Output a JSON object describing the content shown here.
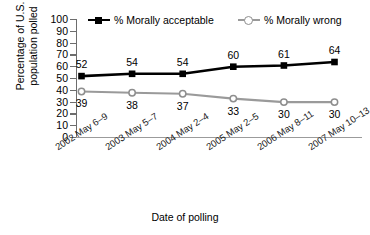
{
  "chart_data": {
    "type": "line",
    "title": "",
    "xlabel": "Date of polling",
    "ylabel": "Percentage of U.S. population polled",
    "ylabel_lines": [
      "Percentage of U.S.",
      "population polled"
    ],
    "categories": [
      "2002 May 6–9",
      "2003 May 5–7",
      "2004 May 2–4",
      "2005 May 2–5",
      "2006 May 8–11",
      "2007 May 10–13"
    ],
    "series": [
      {
        "name": "% Morally acceptable",
        "values": [
          52,
          54,
          54,
          60,
          61,
          64
        ],
        "color": "#000000",
        "marker": "filled-square",
        "label_position": "above"
      },
      {
        "name": "% Morally wrong",
        "values": [
          39,
          38,
          37,
          33,
          30,
          30
        ],
        "color": "#9a9a9a",
        "marker": "open-circle",
        "label_position": "below"
      }
    ],
    "ylim": [
      0,
      100
    ],
    "yticks": [
      0,
      10,
      20,
      30,
      40,
      50,
      60,
      70,
      80,
      90,
      100
    ],
    "ytick_labels": [
      "0",
      "10",
      "20",
      "30",
      "40",
      "50",
      "60",
      "70",
      "80",
      "90",
      "100"
    ],
    "grid": false,
    "legend_position": "top"
  },
  "legend": {
    "acceptable": "% Morally acceptable",
    "wrong": "% Morally wrong"
  },
  "axes": {
    "x_title": "Date of polling",
    "y_title_line1": "Percentage of U.S.",
    "y_title_line2": "population polled"
  }
}
